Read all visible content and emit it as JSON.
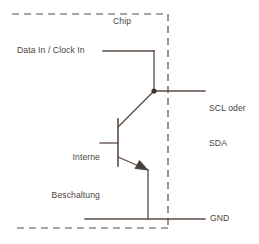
{
  "diagram": {
    "colors": {
      "wire": "#5a4a42",
      "dashed_boundary": "#5a4a42",
      "text": "#4b4441",
      "background": "#ffffff",
      "junction_dot": "#3d332e"
    },
    "labels": {
      "chip": "Chip",
      "data_in": "Data In / Clock In",
      "bus_line_1": "SCL oder",
      "bus_line_2": "SDA",
      "internal_line_1": "Interne",
      "internal_line_2": "Beschaltung",
      "ground": "GND"
    },
    "components": {
      "transistor": {
        "type": "npn-bipolar-transistor",
        "base_bar_x": 118,
        "base_bar_y_top": 119,
        "base_bar_y_bottom": 166,
        "base_lead_y": 143,
        "base_lead_x_start": 100,
        "collector_end_x": 154,
        "collector_end_y": 91,
        "emitter_end_x": 148,
        "emitter_end_y": 170
      },
      "junction": {
        "x": 154,
        "y": 91
      },
      "chip_boundary": {
        "edges": [
          "top",
          "right",
          "bottom"
        ],
        "x_left": 12,
        "x_right": 168,
        "y_top": 14,
        "y_bottom": 228,
        "dash_pattern": "7,5"
      },
      "nets": {
        "data_in_wire_y": 51,
        "data_in_wire_x_start": 103,
        "data_in_wire_x_end": 154,
        "bus_wire_y": 91,
        "bus_wire_x_end": 205,
        "ground_wire_y": 219,
        "ground_wire_x_start": 85,
        "ground_wire_x_end": 205,
        "emitter_drop_x": 148
      }
    }
  }
}
